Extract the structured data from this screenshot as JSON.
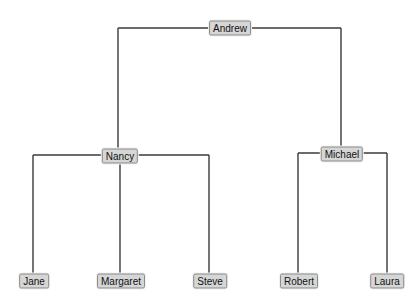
{
  "diagram": {
    "type": "tree",
    "root": "Andrew",
    "nodes": [
      {
        "id": "andrew",
        "label": "Andrew",
        "x": 230,
        "y": 28
      },
      {
        "id": "nancy",
        "label": "Nancy",
        "x": 120,
        "y": 156
      },
      {
        "id": "michael",
        "label": "Michael",
        "x": 342,
        "y": 154
      },
      {
        "id": "jane",
        "label": "Jane",
        "x": 34,
        "y": 281
      },
      {
        "id": "margaret",
        "label": "Margaret",
        "x": 121,
        "y": 281
      },
      {
        "id": "steve",
        "label": "Steve",
        "x": 210,
        "y": 281
      },
      {
        "id": "robert",
        "label": "Robert",
        "x": 299,
        "y": 281
      },
      {
        "id": "laura",
        "label": "Laura",
        "x": 387,
        "y": 281
      }
    ],
    "edges": [
      {
        "from": "Andrew",
        "to": "Nancy"
      },
      {
        "from": "Andrew",
        "to": "Michael"
      },
      {
        "from": "Nancy",
        "to": "Jane"
      },
      {
        "from": "Nancy",
        "to": "Margaret"
      },
      {
        "from": "Nancy",
        "to": "Steve"
      },
      {
        "from": "Michael",
        "to": "Robert"
      },
      {
        "from": "Michael",
        "to": "Laura"
      }
    ]
  }
}
